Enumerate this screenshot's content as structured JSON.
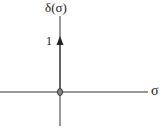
{
  "diagram": {
    "y_axis_label": "δ(σ)",
    "x_axis_label": "σ",
    "impulse_height_label": "1",
    "impulse_location": 0,
    "impulse_height": 1,
    "colors": {
      "axis": "#777777",
      "arrow": "#222222",
      "origin_marker": "#444444",
      "text": "#222222"
    }
  }
}
